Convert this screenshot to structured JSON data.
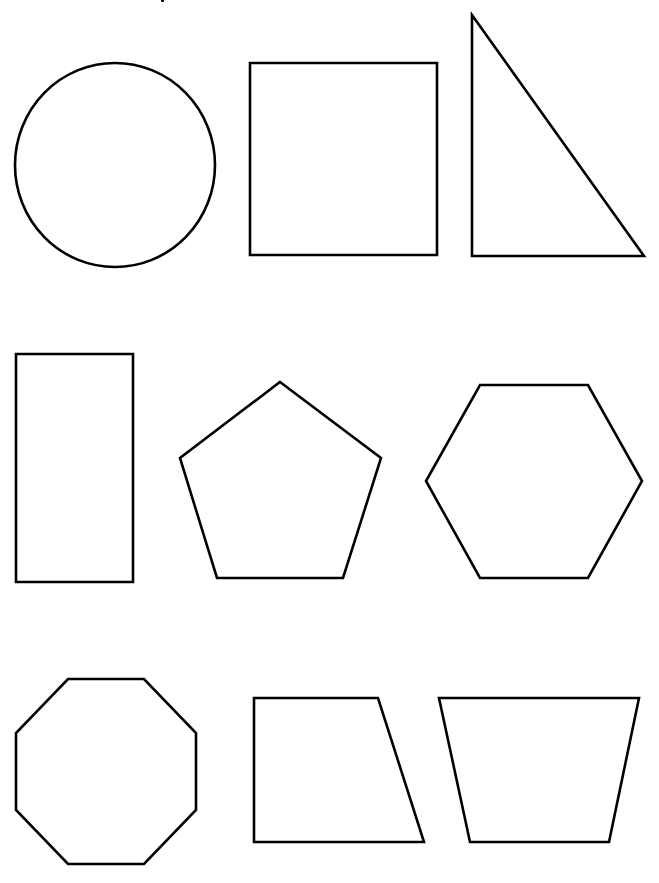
{
  "page": {
    "background": "#ffffff",
    "stroke_color": "#000000",
    "title_fragment": "(cut-off title text at top edge, illegible)"
  },
  "shapes": [
    {
      "name": "circle",
      "type": "ellipse",
      "cx": 115,
      "cy": 165,
      "rx": 100,
      "ry": 102
    },
    {
      "name": "square",
      "type": "polygon",
      "points": "250,63 437,63 437,255 250,255"
    },
    {
      "name": "right-triangle",
      "type": "polygon",
      "points": "472,15 644,256 472,256"
    },
    {
      "name": "rectangle",
      "type": "polygon",
      "points": "16,354 133,354 133,582 16,582"
    },
    {
      "name": "pentagon",
      "type": "polygon",
      "points": "280,382 381,458 343,578 217,578 180,458"
    },
    {
      "name": "hexagon",
      "type": "polygon",
      "points": "480,385 588,385 642,481 588,578 480,578 426,481"
    },
    {
      "name": "octagon",
      "type": "polygon",
      "points": "68,679 144,679 196,733 196,810 144,864 68,864 16,810 16,733"
    },
    {
      "name": "right-trapezoid",
      "type": "polygon",
      "points": "254,698 378,698 424,842 254,842"
    },
    {
      "name": "isosceles-trapezoid",
      "type": "polygon",
      "points": "439,698 639,698 609,842 470,842"
    }
  ]
}
